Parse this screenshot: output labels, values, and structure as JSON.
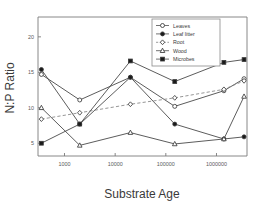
{
  "chart_data": {
    "type": "line",
    "title": "",
    "xlabel": "Substrate Age",
    "ylabel": "N:P Ratio",
    "xscale": "log",
    "xlim": [
      300,
      4000000
    ],
    "ylim": [
      3.2,
      22.8
    ],
    "grid": false,
    "legend_position": "top-right",
    "xticks": [
      1000,
      10000,
      100000,
      1000000
    ],
    "xticklabels": [
      "1000",
      "10000",
      "100000",
      "1000000"
    ],
    "yticks": [
      5,
      10,
      15,
      20
    ],
    "yticklabels": [
      "5",
      "10",
      "15",
      "20"
    ],
    "x": [
      350,
      2000,
      20000,
      150000,
      1400000,
      3500000
    ],
    "series": [
      {
        "name": "Leaves",
        "marker": "open-circle",
        "linestyle": "solid",
        "values": [
          14.7,
          11.1,
          14.3,
          10.2,
          12.4,
          14.1
        ]
      },
      {
        "name": "Leaf litter",
        "marker": "filled-circle",
        "linestyle": "solid",
        "values": [
          15.4,
          7.7,
          14.3,
          7.7,
          5.6,
          5.9
        ]
      },
      {
        "name": "Root",
        "marker": "open-diamond",
        "linestyle": "dashed",
        "values": [
          8.4,
          9.3,
          10.5,
          11.4,
          12.6,
          13.8
        ]
      },
      {
        "name": "Wood",
        "marker": "open-triangle",
        "linestyle": "solid",
        "values": [
          10.0,
          4.7,
          6.5,
          4.9,
          5.6,
          11.6
        ]
      },
      {
        "name": "Microbes",
        "marker": "filled-square",
        "linestyle": "solid",
        "values": [
          5.0,
          7.7,
          16.6,
          13.7,
          16.4,
          16.8
        ]
      }
    ],
    "legend_entries": [
      {
        "label": "Leaves",
        "marker": "open-circle",
        "linestyle": "solid"
      },
      {
        "label": "Leaf litter",
        "marker": "filled-circle",
        "linestyle": "solid"
      },
      {
        "label": "Root",
        "marker": "open-diamond",
        "linestyle": "dashed"
      },
      {
        "label": "Wood",
        "marker": "open-triangle",
        "linestyle": "solid"
      },
      {
        "label": "Microbes",
        "marker": "filled-square",
        "linestyle": "solid"
      }
    ],
    "colors": {
      "line": "#4a4a4a",
      "dashed_line": "#8a8a8a",
      "marker_edge": "#3a3a3a",
      "marker_fill_open": "#ffffff",
      "marker_fill_closed": "#1a1a1a",
      "axis": "#7a7a7a",
      "text": "#3a3a3a",
      "background": "#ffffff"
    }
  }
}
